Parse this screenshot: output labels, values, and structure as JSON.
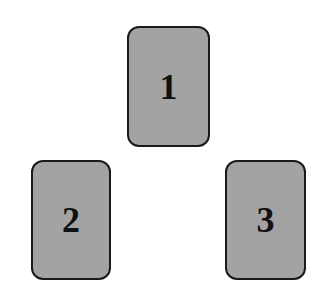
{
  "diagram": {
    "card_color": "#a3a3a3",
    "border_color": "#1a1a1a",
    "cards": [
      {
        "label": "1",
        "x": 127,
        "y": 26,
        "w": 83,
        "h": 121
      },
      {
        "label": "2",
        "x": 31,
        "y": 160,
        "w": 80,
        "h": 120
      },
      {
        "label": "3",
        "x": 225,
        "y": 160,
        "w": 81,
        "h": 120
      }
    ]
  }
}
